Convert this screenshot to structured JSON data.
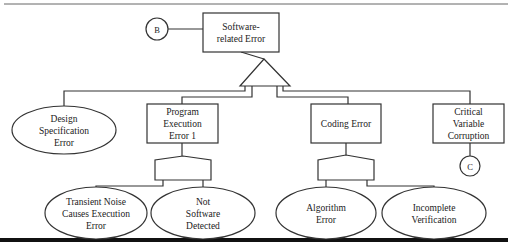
{
  "diagram": {
    "type": "fault-tree",
    "top_event": {
      "id": "software-related-error",
      "lines": [
        "Software-",
        "related Error"
      ],
      "shape": "rectangle",
      "box": [
        203,
        13,
        76,
        39
      ]
    },
    "transfer_in": {
      "id": "transfer-b",
      "label": "B",
      "shape": "circle",
      "cx": 157,
      "cy": 29,
      "r": 11
    },
    "top_gate": {
      "id": "or-gate-top",
      "type": "OR",
      "apex": [
        264,
        59
      ],
      "base_y": 86,
      "base_x": [
        240,
        290
      ]
    },
    "events": [
      {
        "id": "design-specification-error",
        "lines": [
          "Design",
          "Specification",
          "Error"
        ],
        "shape": "ellipse",
        "cx": 64,
        "cy": 130,
        "rx": 52,
        "ry": 24,
        "wire": [
          [
            245,
            86
          ],
          [
            245,
            91
          ],
          [
            64,
            91
          ],
          [
            64,
            106
          ]
        ]
      },
      {
        "id": "program-execution-error-1",
        "lines": [
          "Program",
          "Execution",
          "Error 1"
        ],
        "shape": "rectangle",
        "box": [
          147,
          104,
          71,
          39
        ],
        "wire": [
          [
            252,
            86
          ],
          [
            252,
            97
          ],
          [
            182,
            97
          ],
          [
            182,
            104
          ]
        ],
        "gate": {
          "type": "AND",
          "x": 155,
          "w": 56,
          "top": 156,
          "shoulder": 160,
          "bottom": 180,
          "stem": [
            [
              182,
              143
            ],
            [
              182,
              156
            ]
          ]
        },
        "children": [
          {
            "id": "transient-noise",
            "lines": [
              "Transient Noise",
              "Causes Execution",
              "Error"
            ],
            "shape": "ellipse",
            "cx": 96,
            "cy": 213,
            "rx": 51,
            "ry": 26,
            "wire": [
              [
                163,
                180
              ],
              [
                163,
                186
              ],
              [
                96,
                186
              ],
              [
                96,
                187
              ]
            ]
          },
          {
            "id": "not-software-detected",
            "lines": [
              "Not",
              "Software",
              "Detected"
            ],
            "shape": "ellipse",
            "cx": 203,
            "cy": 213,
            "rx": 52,
            "ry": 26,
            "wire": [
              [
                203,
                180
              ],
              [
                203,
                187
              ]
            ]
          }
        ]
      },
      {
        "id": "coding-error",
        "lines": [
          "Coding Error"
        ],
        "shape": "rectangle",
        "box": [
          311,
          104,
          70,
          39
        ],
        "wire": [
          [
            277,
            86
          ],
          [
            277,
            97
          ],
          [
            348,
            97
          ],
          [
            348,
            104
          ]
        ],
        "gate": {
          "type": "AND",
          "x": 318,
          "w": 56,
          "top": 155,
          "shoulder": 160,
          "bottom": 180,
          "stem": [
            [
              346,
              143
            ],
            [
              346,
              155
            ]
          ]
        },
        "children": [
          {
            "id": "algorithm-error",
            "lines": [
              "Algorithm",
              "Error"
            ],
            "shape": "ellipse",
            "cx": 326,
            "cy": 213,
            "rx": 50,
            "ry": 26,
            "wire": [
              [
                326,
                180
              ],
              [
                326,
                187
              ]
            ]
          },
          {
            "id": "incomplete-verification",
            "lines": [
              "Incomplete",
              "Verification"
            ],
            "shape": "ellipse",
            "cx": 434,
            "cy": 213,
            "rx": 52,
            "ry": 26,
            "wire": [
              [
                367,
                180
              ],
              [
                367,
                186
              ],
              [
                434,
                186
              ],
              [
                434,
                187
              ]
            ]
          }
        ]
      },
      {
        "id": "critical-variable-corruption",
        "lines": [
          "Critical",
          "Variable",
          "Corruption"
        ],
        "shape": "rectangle",
        "box": [
          433,
          104,
          71,
          39
        ],
        "wire": [
          [
            283,
            86
          ],
          [
            283,
            91
          ],
          [
            470,
            91
          ],
          [
            470,
            104
          ]
        ],
        "transfer_out": {
          "id": "transfer-c",
          "label": "C",
          "shape": "circle",
          "cx": 470,
          "cy": 166,
          "r": 10,
          "wire": [
            [
              470,
              143
            ],
            [
              470,
              156
            ]
          ]
        }
      }
    ],
    "rules": {
      "top": {
        "y": 4,
        "x1": 4,
        "x2": 508,
        "width": 1
      },
      "bottom": {
        "y": 240,
        "x1": 0,
        "x2": 508,
        "width": 4
      }
    },
    "colors": {
      "stroke": "#333333",
      "text": "#222222",
      "background": "#ffffff"
    }
  }
}
